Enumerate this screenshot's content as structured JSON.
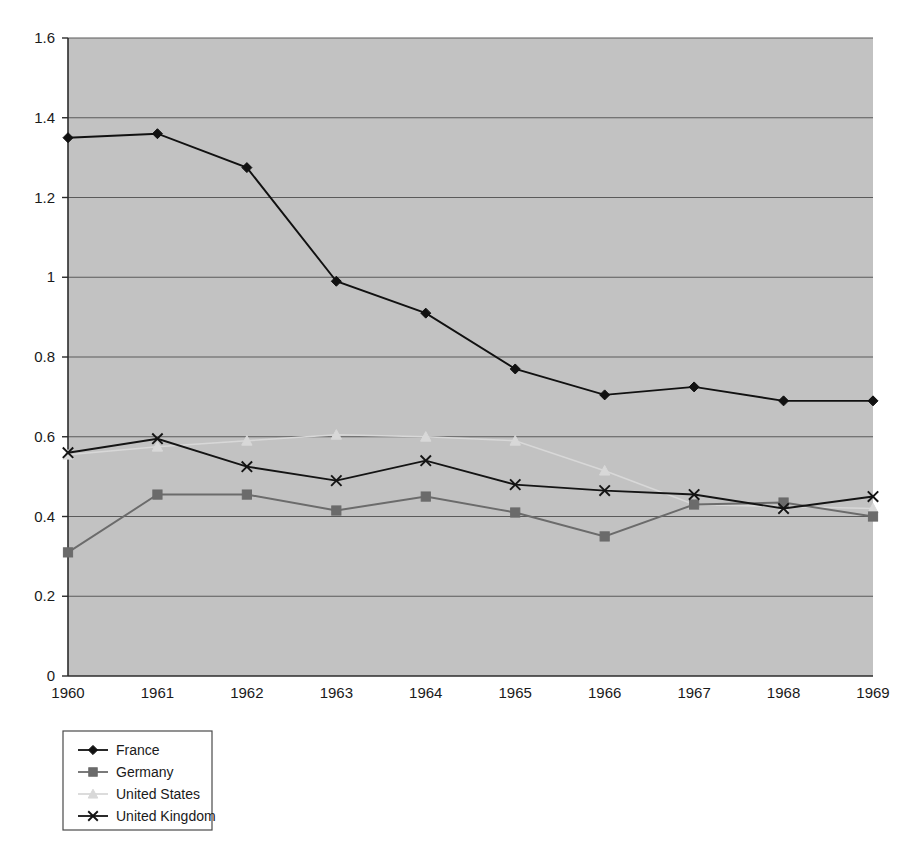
{
  "chart_data": {
    "type": "line",
    "title": "",
    "subtitle": "",
    "xlabel": "",
    "ylabel": "",
    "categories": [
      "1960",
      "1961",
      "1962",
      "1963",
      "1964",
      "1965",
      "1966",
      "1967",
      "1968",
      "1969"
    ],
    "x": [
      1960,
      1961,
      1962,
      1963,
      1964,
      1965,
      1966,
      1967,
      1968,
      1969
    ],
    "ylim": [
      0,
      1.6
    ],
    "xlim": [
      1960,
      1969
    ],
    "yticks": [
      0,
      0.2,
      0.4,
      0.6,
      0.8,
      1,
      1.2,
      1.4,
      1.6
    ],
    "ytick_labels": [
      "0",
      "0.2",
      "0.4",
      "0.6",
      "0.8",
      "1",
      "1.2",
      "1.4",
      "1.6"
    ],
    "grid": "horizontal",
    "legend_position": "bottom-left",
    "plot_background": "#c2c2c2",
    "series": [
      {
        "name": "France",
        "marker": "diamond",
        "color": "#111111",
        "values": [
          1.35,
          1.36,
          1.275,
          0.99,
          0.91,
          0.77,
          0.705,
          0.725,
          0.69,
          0.69
        ]
      },
      {
        "name": "Germany",
        "marker": "square",
        "color": "#6b6b6b",
        "values": [
          0.31,
          0.455,
          0.455,
          0.415,
          0.45,
          0.41,
          0.35,
          0.43,
          0.435,
          0.4
        ]
      },
      {
        "name": "United States",
        "marker": "triangle",
        "color": "#d8d8d8",
        "values": [
          0.555,
          0.575,
          0.59,
          0.605,
          0.6,
          0.59,
          0.515,
          0.43,
          0.425,
          0.42
        ]
      },
      {
        "name": "United Kingdom",
        "marker": "x",
        "color": "#141414",
        "values": [
          0.56,
          0.595,
          0.525,
          0.49,
          0.54,
          0.48,
          0.465,
          0.455,
          0.42,
          0.45
        ]
      }
    ]
  },
  "legend": {
    "items": [
      {
        "label": "France",
        "marker": "diamond-marker",
        "color": "#111111"
      },
      {
        "label": "Germany",
        "marker": "square-marker",
        "color": "#6b6b6b"
      },
      {
        "label": "United States",
        "marker": "triangle-marker",
        "color": "#d8d8d8"
      },
      {
        "label": "United Kingdom",
        "marker": "x-marker",
        "color": "#141414"
      }
    ]
  }
}
